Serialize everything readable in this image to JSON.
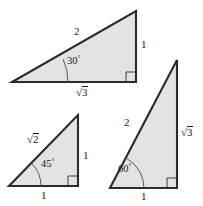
{
  "figure": {
    "background_color": "#ffffff",
    "fill_color": "#e3e3e3",
    "stroke_color": "#2b2b2b"
  },
  "triangles": [
    {
      "id": "triangle-30-60-90",
      "name": "30-60-90 triangle",
      "angle_label": "30",
      "angle_degree_symbol": "°",
      "labels": {
        "hypotenuse": "2",
        "vertical_leg": "1",
        "horizontal_leg_radicand": "3",
        "radical_symbol": "√"
      }
    },
    {
      "id": "triangle-45-45-90",
      "name": "45-45-90 triangle",
      "angle_label": "45",
      "angle_degree_symbol": "°",
      "labels": {
        "hypotenuse_radicand": "2",
        "radical_symbol": "√",
        "vertical_leg": "1",
        "horizontal_leg": "1"
      }
    },
    {
      "id": "triangle-60-30-90",
      "name": "60-30-90 triangle",
      "angle_label": "60",
      "angle_degree_symbol": "°",
      "labels": {
        "hypotenuse": "2",
        "vertical_leg_radicand": "3",
        "radical_symbol": "√",
        "horizontal_leg": "1"
      }
    }
  ]
}
